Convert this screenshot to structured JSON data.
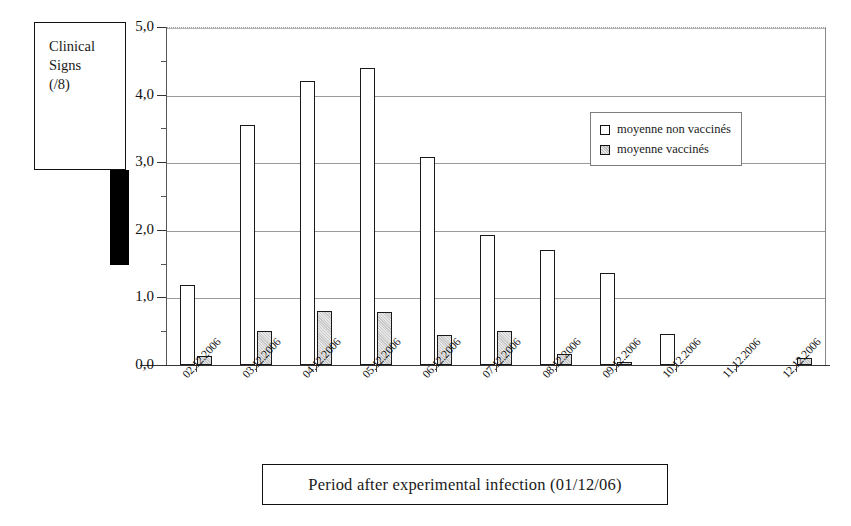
{
  "chart_data": {
    "type": "bar",
    "title": "",
    "xlabel": "Period after experimental infection  (01/12/06)",
    "ylabel": "Clinical Signs (/8)",
    "ylim": [
      0,
      5
    ],
    "ytick_labels": [
      "0,0",
      "1,0",
      "2,0",
      "3,0",
      "4,0",
      "5,0"
    ],
    "ytick_values": [
      0,
      1,
      2,
      3,
      4,
      5
    ],
    "grid": true,
    "legend_position": "top-right",
    "categories": [
      "02.12.2006",
      "03.12.2006",
      "04.12.2006",
      "05.12.2006",
      "06.12.2006",
      "07.12.2006",
      "08.12.2006",
      "09.12.2006",
      "10.12.2006",
      "11.12.2006",
      "12.12.2006"
    ],
    "series": [
      {
        "name": "moyenne non vaccinés",
        "fill": "white",
        "values": [
          1.19,
          3.55,
          4.2,
          4.4,
          3.07,
          1.93,
          1.7,
          1.36,
          0.46,
          0.0,
          0.0
        ]
      },
      {
        "name": "moyenne vaccinés",
        "fill": "hatched-grey",
        "values": [
          0.13,
          0.51,
          0.8,
          0.78,
          0.45,
          0.5,
          0.17,
          0.05,
          0.0,
          0.0,
          0.1
        ]
      }
    ]
  },
  "y_axis_title": {
    "line1": "Clinical",
    "line2": "Signs",
    "line3": "(/8)"
  },
  "legend": {
    "items": [
      {
        "label": "moyenne non vaccinés",
        "swatch": "white-square-icon"
      },
      {
        "label": "moyenne vaccinés",
        "swatch": "hatched-square-icon"
      }
    ]
  },
  "x_axis_title": "Period after experimental infection  (01/12/06)",
  "colors": {
    "unvaccinated_fill": "#ffffff",
    "vaccinated_fill": "#c9c9c9",
    "outline": "#1a1a1a",
    "gridline": "#9a9a9a",
    "background": "#ffffff"
  }
}
